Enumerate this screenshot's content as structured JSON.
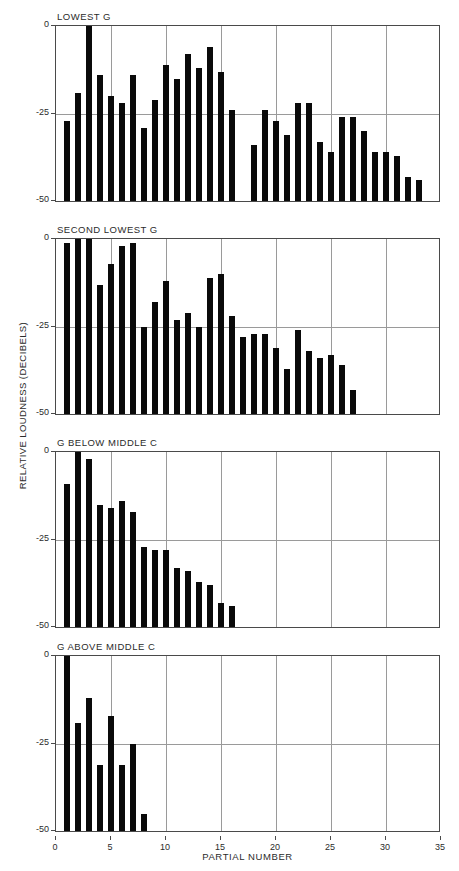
{
  "chart_data": {
    "type": "bar",
    "title": "",
    "xlabel": "PARTIAL NUMBER",
    "ylabel": "RELATIVE LOUDNESS (DECIBELS)",
    "xlim": [
      0,
      35
    ],
    "ylim": [
      -50,
      0
    ],
    "xticks": [
      0,
      5,
      10,
      15,
      20,
      25,
      30,
      35
    ],
    "yticks": [
      0,
      -25,
      -50
    ],
    "ytick_labels": [
      "0",
      "-25",
      "-50"
    ],
    "grid": "both",
    "legend": "none",
    "panels": [
      {
        "label": "LOWEST G",
        "partials": [
          1,
          2,
          3,
          4,
          5,
          6,
          7,
          8,
          9,
          10,
          11,
          12,
          13,
          14,
          15,
          16,
          18,
          19,
          20,
          21,
          22,
          23,
          24,
          25,
          26,
          27,
          28,
          29,
          30,
          31,
          32,
          33
        ],
        "values": [
          -27,
          -19,
          0,
          -14,
          -20,
          -22,
          -14,
          -29,
          -21,
          -11,
          -15,
          -8,
          -12,
          -6,
          -13,
          -24,
          -34,
          -24,
          -27,
          -31,
          -22,
          -22,
          -33,
          -36,
          -26,
          -26,
          -30,
          -36,
          -36,
          -37,
          -43,
          -44
        ]
      },
      {
        "label": "SECOND LOWEST G",
        "partials": [
          1,
          2,
          3,
          4,
          5,
          6,
          7,
          8,
          9,
          10,
          11,
          12,
          13,
          14,
          15,
          16,
          17,
          18,
          19,
          20,
          21,
          22,
          23,
          24,
          25,
          26,
          27
        ],
        "values": [
          -1,
          0,
          0,
          -13,
          -7,
          -2,
          -1,
          -25,
          -18,
          -12,
          -23,
          -21,
          -25,
          -11,
          -10,
          -22,
          -28,
          -27,
          -27,
          -31,
          -37,
          -26,
          -32,
          -34,
          -33,
          -36,
          -43
        ]
      },
      {
        "label": "G BELOW MIDDLE C",
        "partials": [
          1,
          2,
          3,
          4,
          5,
          6,
          7,
          8,
          9,
          10,
          11,
          12,
          13,
          14,
          15,
          16
        ],
        "values": [
          -9,
          0,
          -2,
          -15,
          -16,
          -14,
          -17,
          -27,
          -28,
          -28,
          -33,
          -34,
          -37,
          -38,
          -43,
          -44
        ]
      },
      {
        "label": "G ABOVE MIDDLE C",
        "partials": [
          1,
          2,
          3,
          4,
          5,
          6,
          7,
          8
        ],
        "values": [
          0,
          -19,
          -12,
          -31,
          -17,
          -31,
          -25,
          -45
        ]
      }
    ]
  },
  "colors": {
    "bar": "#0a0a0a",
    "grid": "#9a9a9a",
    "axis": "#4a4a4a",
    "background": "#ffffff",
    "text": "#2b2b2b"
  }
}
